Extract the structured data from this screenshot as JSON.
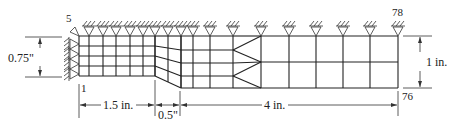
{
  "labels": {
    "node_top_left": "5",
    "node_bottom_left": "1",
    "node_top_right": "78",
    "node_bottom_right": "76",
    "dim_left_height": "0.75\"",
    "dim_right_height": "1 in.",
    "dim_len_1": "1.5 in.",
    "dim_len_2": "0.5\"",
    "dim_len_3": "4 in."
  },
  "mesh": {
    "top_y": 36,
    "left_rows_y": [
      36,
      46,
      56,
      66,
      76
    ],
    "left_cols_x": [
      79,
      89,
      103,
      116,
      130,
      143,
      155
    ],
    "taper_cols_x": [
      155,
      168,
      181
    ],
    "mid_rows_y": [
      36,
      50,
      63,
      76,
      88
    ],
    "mid_cols_x": [
      181,
      193,
      210,
      233
    ],
    "right_rows_y": [
      36,
      62,
      88
    ],
    "right_cols_x": [
      261,
      289,
      316,
      343,
      370,
      398
    ],
    "fan_from_x": 233,
    "fan_to_x": 261
  },
  "supports": {
    "top_roller_x": [
      89,
      103,
      116,
      130,
      143,
      155,
      168,
      181,
      193,
      210,
      233,
      261,
      289,
      316,
      343,
      370,
      398
    ],
    "left_pin_y": [
      44,
      54,
      64,
      74
    ]
  },
  "icons": {
    "roller_support": "roller-support-icon",
    "pin_support": "pin-support-icon"
  }
}
